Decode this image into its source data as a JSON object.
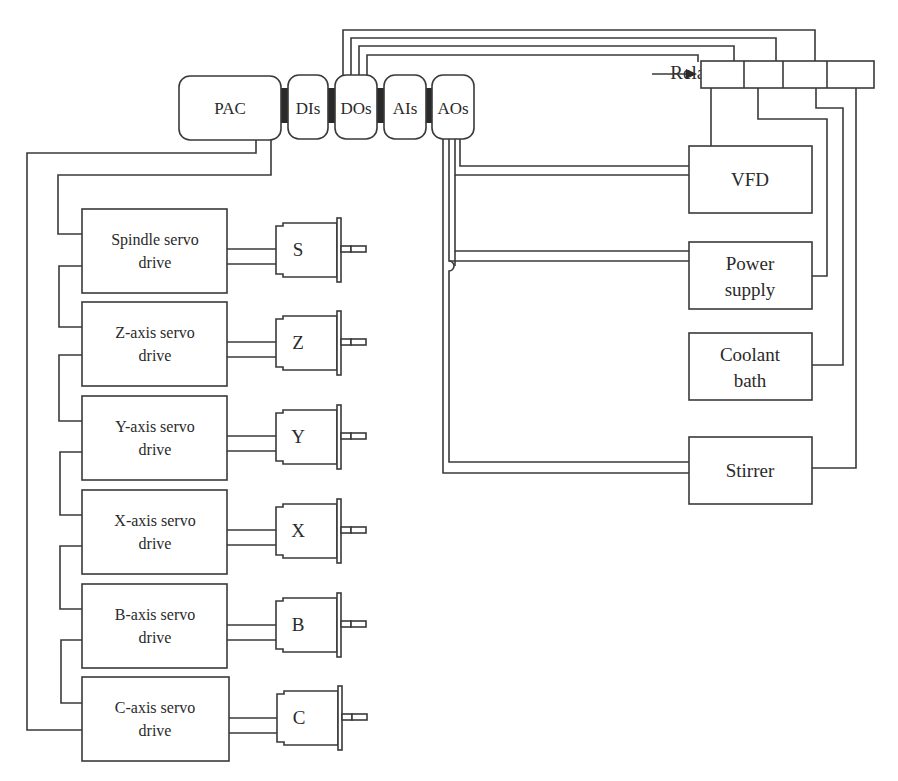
{
  "diagram": {
    "controller": {
      "pac": "PAC",
      "modules": [
        "DIs",
        "DOs",
        "AIs",
        "AOs"
      ]
    },
    "relays": {
      "label": "Relays",
      "count": 4
    },
    "servo_drives": [
      {
        "line1": "Spindle servo",
        "line2": "drive",
        "motor": "S"
      },
      {
        "line1": "Z-axis servo",
        "line2": "drive",
        "motor": "Z"
      },
      {
        "line1": "Y-axis servo",
        "line2": "drive",
        "motor": "Y"
      },
      {
        "line1": "X-axis servo",
        "line2": "drive",
        "motor": "X"
      },
      {
        "line1": "B-axis servo",
        "line2": "drive",
        "motor": "B"
      },
      {
        "line1": "C-axis servo",
        "line2": "drive",
        "motor": "C"
      }
    ],
    "peripherals": [
      {
        "line1": "VFD",
        "line2": ""
      },
      {
        "line1": "Power",
        "line2": "supply"
      },
      {
        "line1": "Coolant",
        "line2": "bath"
      },
      {
        "line1": "Stirrer",
        "line2": ""
      }
    ],
    "colors": {
      "line": "#3a3a3a",
      "text": "#2a2a2a",
      "background": "#ffffff"
    }
  }
}
